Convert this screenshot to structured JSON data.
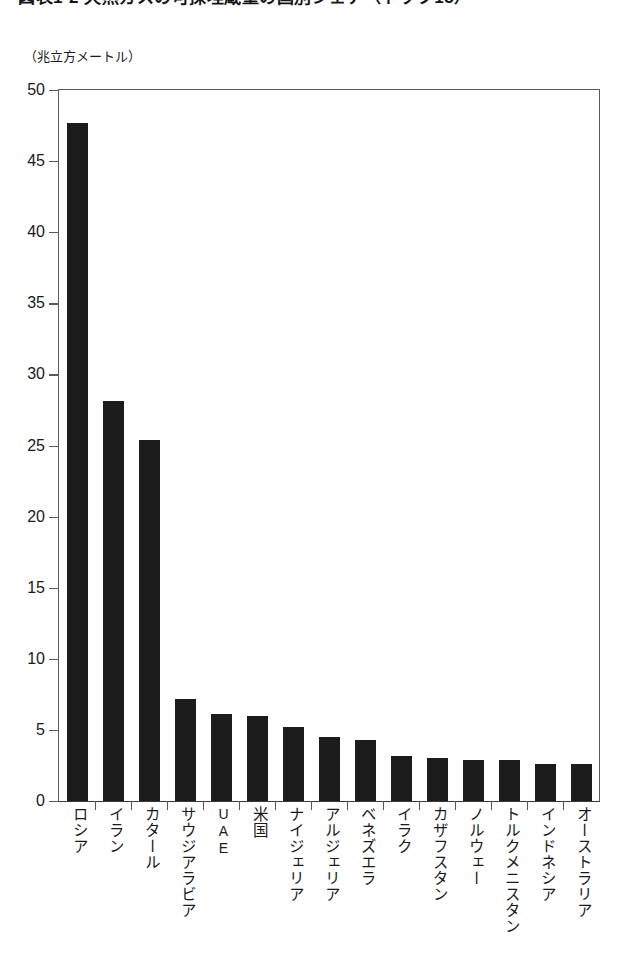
{
  "figure": {
    "title_partial": "図表1-2 天然ガスの可採埋蔵量の国別シェア（トップ15）",
    "unit_caption": "（兆立方メートル）"
  },
  "chart_data": {
    "type": "bar",
    "title": "",
    "xlabel": "",
    "ylabel": "（兆立方メートル）",
    "ylim": [
      0,
      50
    ],
    "yticks": [
      0,
      5,
      10,
      15,
      20,
      25,
      30,
      35,
      40,
      45,
      50
    ],
    "ytick_labels": [
      "0",
      "5",
      "10",
      "15",
      "20",
      "25",
      "30",
      "35",
      "40",
      "45",
      "50"
    ],
    "grid": false,
    "legend": null,
    "bar_color": "#1c1c1c",
    "categories": [
      "ロシア",
      "イラン",
      "カタール",
      "サウジアラビア",
      "UAE",
      "米国",
      "ナイジェリア",
      "アルジェリア",
      "ベネズエラ",
      "イラク",
      "カザフスタン",
      "ノルウェー",
      "トルクメニスタン",
      "インドネシア",
      "オーストラリア"
    ],
    "values": [
      47.7,
      28.1,
      25.4,
      7.2,
      6.1,
      6.0,
      5.2,
      4.5,
      4.3,
      3.2,
      3.0,
      2.9,
      2.9,
      2.6,
      2.6
    ]
  }
}
